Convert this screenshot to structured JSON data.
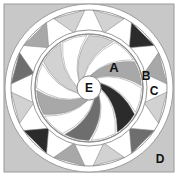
{
  "figure": {
    "canvas": {
      "width": 178,
      "height": 190
    },
    "caption": "",
    "background": {
      "fill": "#c8c8c8",
      "border": "#9a9a9a",
      "plate": {
        "x": 4,
        "y": 4,
        "width": 170,
        "height": 168
      }
    },
    "colors": {
      "white": "#ffffff",
      "light_gray": "#d2d2d2",
      "mid_gray": "#a8a8a8",
      "dark_gray": "#6e6e6e",
      "near_black": "#2b2b2b",
      "outline": "#8c8c8c",
      "label_text": "#111111",
      "page_background": "#c8c8c8"
    },
    "geometry": {
      "center_x": 89,
      "center_y": 88,
      "outer_circle_radius": 84,
      "ring_outer_radius": 78,
      "ring_inner_radius": 58,
      "inner_disc_radius": 54,
      "hub_radius": 12,
      "outer_triangle_count": 12,
      "blade_count": 12
    },
    "labels": [
      {
        "id": "A",
        "text": "A",
        "x": 114,
        "y": 72,
        "size": 13,
        "region": "inner-white-blade"
      },
      {
        "id": "B",
        "text": "B",
        "x": 146,
        "y": 80,
        "size": 12,
        "region": "outer-ring-gray-triangle"
      },
      {
        "id": "C",
        "text": "C",
        "x": 154,
        "y": 95,
        "size": 12,
        "region": "outer-ring-white-gap"
      },
      {
        "id": "D",
        "text": "D",
        "x": 160,
        "y": 163,
        "size": 12,
        "region": "background-corner"
      },
      {
        "id": "E",
        "text": "E",
        "x": 89,
        "y": 92,
        "size": 12,
        "region": "center-hub"
      }
    ],
    "outer_ring_triangle_shades": [
      "#d2d2d2",
      "#2b2b2b",
      "#a8a8a8",
      "#d2d2d2",
      "#6e6e6e",
      "#d2d2d2",
      "#a8a8a8",
      "#2b2b2b",
      "#d2d2d2",
      "#6e6e6e",
      "#a8a8a8",
      "#d2d2d2"
    ],
    "blade_shades": [
      "#d2d2d2",
      "#ffffff",
      "#a8a8a8",
      "#ffffff",
      "#2b2b2b",
      "#ffffff",
      "#6e6e6e",
      "#ffffff",
      "#a8a8a8",
      "#ffffff",
      "#d2d2d2",
      "#ffffff"
    ]
  }
}
